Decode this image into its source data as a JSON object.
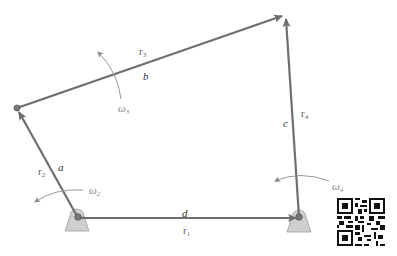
{
  "figure": {
    "type": "four-bar linkage vector loop diagram",
    "links": [
      {
        "id": "a",
        "label": "a",
        "vector": "r",
        "vector_sub": "2",
        "from": "O2",
        "to": "A"
      },
      {
        "id": "b",
        "label": "b",
        "vector": "r",
        "vector_sub": "3",
        "from": "A",
        "to": "B"
      },
      {
        "id": "c",
        "label": "c",
        "vector": "r",
        "vector_sub": "4",
        "from": "O4",
        "to": "B"
      },
      {
        "id": "d",
        "label": "d",
        "vector": "r",
        "vector_sub": "1",
        "from": "O2",
        "to": "O4"
      }
    ],
    "angular_velocities": [
      {
        "symbol": "ω",
        "sub": "2"
      },
      {
        "symbol": "ω",
        "sub": "3"
      },
      {
        "symbol": "ω",
        "sub": "4"
      }
    ],
    "colors": {
      "link": "#6e6e6e",
      "ground": "#c8c8c8",
      "ground_edge": "#9a9a9a",
      "omega_arc": "#999999",
      "label": "#333333"
    }
  },
  "labels": {
    "a": "a",
    "b": "b",
    "c": "c",
    "d": "d",
    "r": "r",
    "r1_sub": "1",
    "r2_sub": "2",
    "r3_sub": "3",
    "r4_sub": "4",
    "omega": "ω",
    "w2_sub": "2",
    "w3_sub": "3",
    "w4_sub": "4"
  },
  "qr_code": {
    "present": true
  }
}
